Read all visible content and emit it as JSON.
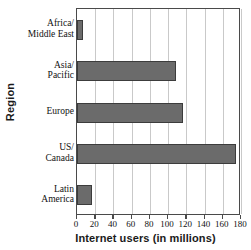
{
  "chart_data": {
    "type": "bar",
    "orientation": "horizontal",
    "title": "",
    "xlabel": "Internet users (in millions)",
    "ylabel": "Region",
    "categories": [
      "Africa/ Middle East",
      "Asia/ Pacific",
      "Europe",
      "US/ Canada",
      "Latin America"
    ],
    "category_lines": [
      [
        "Africa/",
        "Middle East"
      ],
      [
        "Asia/",
        "Pacific"
      ],
      [
        "Europe"
      ],
      [
        "US/",
        "Canada"
      ],
      [
        "Latin",
        "America"
      ]
    ],
    "values": [
      7,
      109,
      116,
      175,
      16
    ],
    "xlim": [
      0,
      180
    ],
    "xticks": [
      0,
      20,
      40,
      60,
      80,
      100,
      120,
      140,
      160,
      180
    ],
    "xtick_labels": [
      "0",
      "20",
      "40",
      "60",
      "80",
      "100",
      "120",
      "140",
      "160",
      "180"
    ],
    "grid": "vertical",
    "legend": "none",
    "bar_color": "#6b6b6b",
    "bar_edge_color": "#3c3c3c",
    "grid_color": "#c9c9c9",
    "axis_color": "#4a4a4a",
    "background_color": "#ffffff"
  }
}
